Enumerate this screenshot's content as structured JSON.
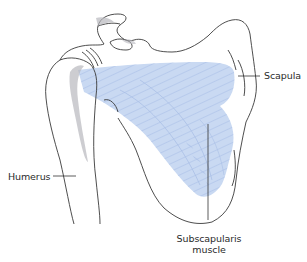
{
  "diagram": {
    "colors": {
      "outline": "#3a3a3a",
      "muscle_fill": "#c9d9f2",
      "muscle_fiber": "#a9bfe6",
      "shadow": "#b8b8be",
      "leader_line": "#333333",
      "background": "#ffffff"
    },
    "labels": [
      {
        "id": "scapula",
        "text": "Scapula",
        "x": 263,
        "y": 70,
        "leader": "left"
      },
      {
        "id": "humerus",
        "text": "Humerus",
        "x": 8,
        "y": 168,
        "leader": "right"
      },
      {
        "id": "subscapularis",
        "line1": "Subscapularis",
        "line2": "muscle",
        "x": 176,
        "y": 233,
        "leader": "up"
      }
    ]
  }
}
